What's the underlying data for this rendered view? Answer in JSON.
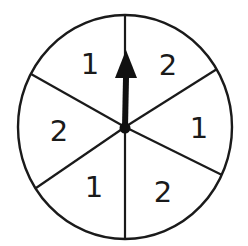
{
  "spinner": {
    "center": {
      "x": 125,
      "y": 127
    },
    "radius_x": 107,
    "radius_y": 112,
    "sector_count": 6,
    "dividers": [
      {
        "x1": 125,
        "y1": 127,
        "x2": 125,
        "y2": 15
      },
      {
        "x1": 125,
        "y1": 127,
        "x2": 217,
        "y2": 69
      },
      {
        "x1": 125,
        "y1": 127,
        "x2": 222,
        "y2": 175
      },
      {
        "x1": 125,
        "y1": 127,
        "x2": 125,
        "y2": 239
      },
      {
        "x1": 125,
        "y1": 127,
        "x2": 36,
        "y2": 188
      },
      {
        "x1": 125,
        "y1": 127,
        "x2": 31,
        "y2": 74
      }
    ],
    "sectors": [
      {
        "label": "1",
        "x": 90,
        "y": 64
      },
      {
        "label": "2",
        "x": 168,
        "y": 65
      },
      {
        "label": "1",
        "x": 199,
        "y": 128
      },
      {
        "label": "2",
        "x": 163,
        "y": 192
      },
      {
        "label": "1",
        "x": 94,
        "y": 187
      },
      {
        "label": "2",
        "x": 59,
        "y": 131
      }
    ],
    "arrow": {
      "points_to": "top",
      "tip": {
        "x": 126,
        "y": 50
      },
      "head_base_y": 78,
      "head_half_width": 11
    },
    "colors": {
      "line": "#1a1a1a",
      "arrow": "#111111",
      "background": "#ffffff"
    }
  }
}
